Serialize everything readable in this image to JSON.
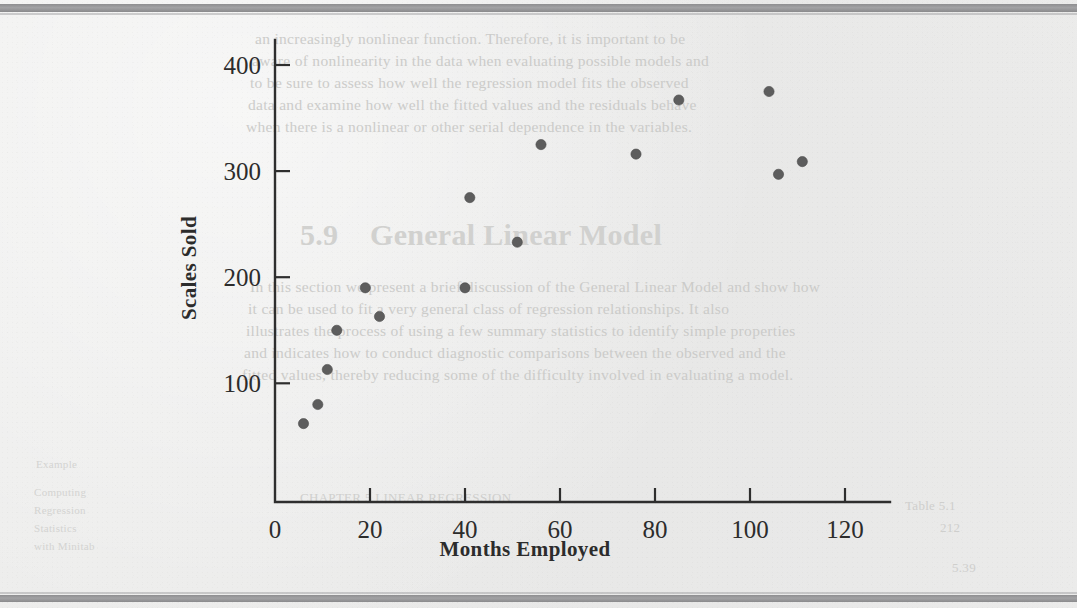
{
  "document": {
    "kind": "scanned-textbook-page",
    "figure_type": "scatterplot"
  },
  "chart_data": {
    "type": "scatter",
    "title": "",
    "xlabel": "Months Employed",
    "ylabel": "Scales Sold",
    "xlim": [
      0,
      130
    ],
    "ylim": [
      0,
      430
    ],
    "xticks": [
      0,
      20,
      40,
      60,
      80,
      100,
      120
    ],
    "xtick_labels": [
      "0",
      "20",
      "40",
      "60",
      "80",
      "100",
      "120"
    ],
    "yticks": [
      100,
      200,
      300,
      400
    ],
    "ytick_labels": [
      "100",
      "200",
      "300",
      "400"
    ],
    "grid": false,
    "legend": false,
    "marker": "filled-circle",
    "marker_color": "#5d5d5d",
    "points": [
      {
        "x": 6,
        "y": 62
      },
      {
        "x": 9,
        "y": 80
      },
      {
        "x": 11,
        "y": 113
      },
      {
        "x": 13,
        "y": 150
      },
      {
        "x": 19,
        "y": 190
      },
      {
        "x": 22,
        "y": 163
      },
      {
        "x": 40,
        "y": 190
      },
      {
        "x": 41,
        "y": 275
      },
      {
        "x": 51,
        "y": 233
      },
      {
        "x": 56,
        "y": 325
      },
      {
        "x": 76,
        "y": 316
      },
      {
        "x": 85,
        "y": 367
      },
      {
        "x": 104,
        "y": 375
      },
      {
        "x": 106,
        "y": 297
      },
      {
        "x": 111,
        "y": 309
      }
    ]
  },
  "axis": {
    "y_title": "Scales Sold",
    "x_title": "Months Employed"
  },
  "colors": {
    "page": "#ececeb",
    "ink": "#2c2c2c",
    "marker": "#5d5d5d",
    "scan_band": "#9a9a9c",
    "ghost_text": "#c9c9c7"
  },
  "bleed_through": {
    "heading": "General Linear Model",
    "heading_number": "5.9",
    "paragraph_top": [
      "an increasingly nonlinear function. Therefore, it is important to be",
      "aware of nonlinearity in the data when evaluating possible models and",
      "to be sure to assess how well the regression model fits the observed",
      "data and examine how well the fitted values and the residuals behave",
      "when there is a nonlinear or other serial dependence in the variables."
    ],
    "paragraph_lower": [
      "In this section we present a brief discussion of the General Linear Model and show how",
      "it can be used to fit a very general class of regression relationships. It also",
      "illustrates the process of using a few summary statistics to identify simple properties",
      "and indicates how to conduct diagnostic comparisons between the observed and the",
      "fitted values, thereby reducing some of the difficulty involved in evaluating a model."
    ],
    "margin_notes": [
      "Example",
      "Computing",
      "Regression",
      "Statistics",
      "with Minitab"
    ],
    "footer_fragments": [
      "Table 5.1",
      "212",
      "CHAPTER 5  LINEAR REGRESSION",
      "5.39"
    ]
  }
}
